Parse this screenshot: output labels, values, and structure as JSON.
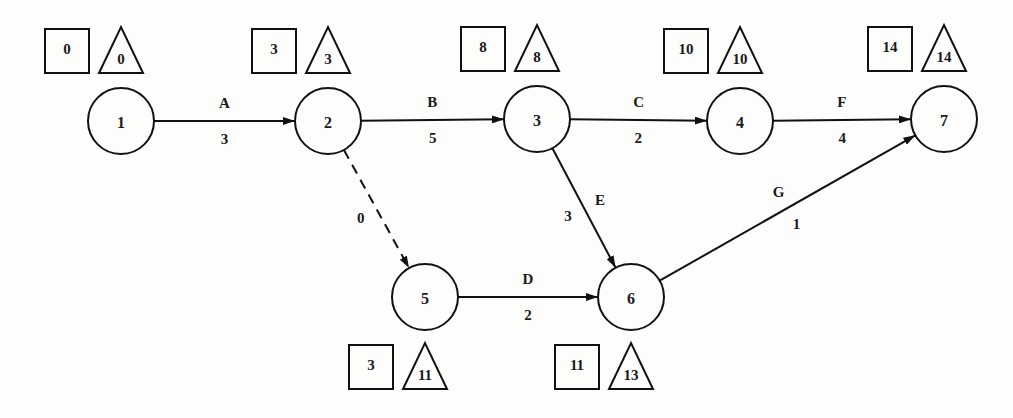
{
  "diagram": {
    "type": "activity-on-arrow network (CPM)",
    "legend": {
      "square": "earliest event time",
      "triangle": "latest event time"
    },
    "nodes": [
      {
        "id": "1",
        "x": 121,
        "y": 121,
        "earliest": "0",
        "latest": "0",
        "marker_pos": "above"
      },
      {
        "id": "2",
        "x": 328,
        "y": 121,
        "earliest": "3",
        "latest": "3",
        "marker_pos": "above"
      },
      {
        "id": "3",
        "x": 537,
        "y": 119,
        "earliest": "8",
        "latest": "8",
        "marker_pos": "above"
      },
      {
        "id": "4",
        "x": 740,
        "y": 121,
        "earliest": "10",
        "latest": "10",
        "marker_pos": "above"
      },
      {
        "id": "7",
        "x": 944,
        "y": 119,
        "earliest": "14",
        "latest": "14",
        "marker_pos": "above"
      },
      {
        "id": "5",
        "x": 425,
        "y": 297,
        "earliest": "3",
        "latest": "11",
        "marker_pos": "below"
      },
      {
        "id": "6",
        "x": 631,
        "y": 297,
        "earliest": "11",
        "latest": "13",
        "marker_pos": "below"
      }
    ],
    "edges": [
      {
        "from": "1",
        "to": "2",
        "name": "A",
        "duration": "3",
        "dashed": false
      },
      {
        "from": "2",
        "to": "3",
        "name": "B",
        "duration": "5",
        "dashed": false
      },
      {
        "from": "3",
        "to": "4",
        "name": "C",
        "duration": "2",
        "dashed": false
      },
      {
        "from": "4",
        "to": "7",
        "name": "F",
        "duration": "4",
        "dashed": false
      },
      {
        "from": "2",
        "to": "5",
        "name": "",
        "duration": "0",
        "dashed": true
      },
      {
        "from": "5",
        "to": "6",
        "name": "D",
        "duration": "2",
        "dashed": false
      },
      {
        "from": "3",
        "to": "6",
        "name": "E",
        "duration": "3",
        "dashed": false
      },
      {
        "from": "6",
        "to": "7",
        "name": "G",
        "duration": "1",
        "dashed": false
      }
    ],
    "colors": {
      "stroke": "#111111",
      "background": "#fdfdfc"
    }
  }
}
